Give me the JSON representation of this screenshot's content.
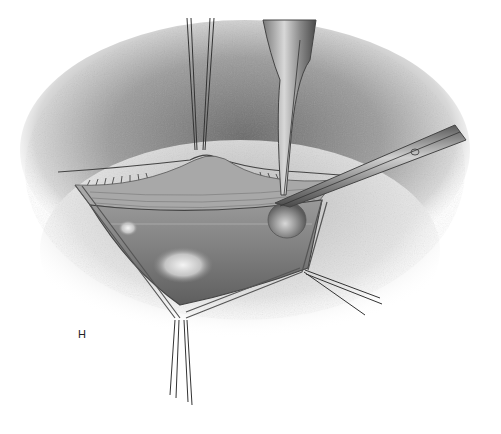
{
  "figure": {
    "panel_label": "H",
    "style": "graphite pencil drawing",
    "colors": {
      "background": "#ffffff",
      "skin_shadow": "#6b6b6b",
      "cavity": "#8a8a8a",
      "instrument": "#9a9a9a",
      "highlight": "#f0f0f0"
    }
  }
}
